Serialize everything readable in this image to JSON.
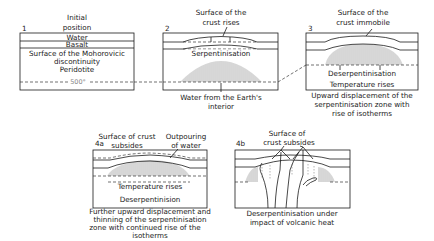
{
  "panels": {
    "p1": {
      "number": "1",
      "title_line1": "Initial",
      "title_line2": "position",
      "layer_water": "Water",
      "layer_basalt": "Basalt",
      "moho_line1": "Surface of the Mohorovicic",
      "moho_line2": "discontinuity",
      "peridotite": "Peridotite",
      "isotherm": "500°"
    },
    "p2": {
      "number": "2",
      "title_line1": "Surface of the",
      "title_line2": "crust rises",
      "serpentinisation": "Serpentinisation",
      "caption_line1": "Water from the Earth's",
      "caption_line2": "interior"
    },
    "p3": {
      "number": "3",
      "title_line1": "Surface of the",
      "title_line2": "crust immobile",
      "deserpentinisation": "Deserpentinisation",
      "temperature": "Temperature rises",
      "caption_line1": "Upward displacement of the",
      "caption_line2": "serpentinisation zone with",
      "caption_line3": "rise of isotherms"
    },
    "p4a": {
      "number": "4a",
      "title_line1": "Surface of crust",
      "title_line2": "subsides",
      "outpouring_line1": "Outpouring",
      "outpouring_line2": "of water",
      "temperature": "Temperature rises",
      "deserpentinisation": "Deserpentinision",
      "caption_line1": "Further upward displacement and",
      "caption_line2": "thinning of the serpentinisation",
      "caption_line3": "zone with continued rise of the",
      "caption_line4": "isotherms"
    },
    "p4b": {
      "number": "4b",
      "title_line1": "Surface of",
      "title_line2": "crust subsides",
      "caption_line1": "Deserpentinisation under",
      "caption_line2": "impact of volcanic heat"
    }
  },
  "colors": {
    "ink": "#1a1a1a",
    "hatch": "#6a6a6a",
    "background": "#ffffff"
  }
}
